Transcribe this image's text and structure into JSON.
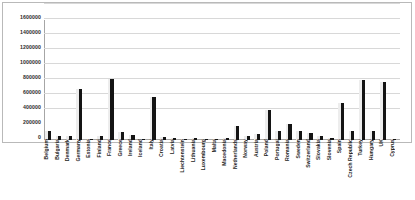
{
  "chart_data": {
    "type": "bar",
    "title": "",
    "xlabel": "",
    "ylabel": "",
    "ylim": [
      0,
      1600000
    ],
    "ytick_step": 200000,
    "grid": true,
    "legend": "none",
    "bar_color": "#141414",
    "gridline_color": "#d8d8d8",
    "axis_color": "#a6a6a6",
    "ytick_labels": [
      "1600000",
      "1400000",
      "1200000",
      "1000000",
      "800000",
      "600000",
      "400000",
      "200000",
      "0"
    ],
    "ytick_values": [
      1600000,
      1400000,
      1200000,
      1000000,
      800000,
      600000,
      400000,
      200000,
      0
    ],
    "categories": [
      "Belgium",
      "Bulgaria",
      "Denmark",
      "Germany",
      "Estonia",
      "Finland",
      "France",
      "Greece",
      "Ireland",
      "Iceland",
      "Italy",
      "Croatia",
      "Latvia",
      "Liechtenstein",
      "Lithuania",
      "Luxembourg",
      "Malta",
      "Macedonia",
      "Netherlands",
      "Norway",
      "Austria",
      "Poland",
      "Portugal",
      "Romania",
      "Sweden",
      "Switzerland",
      "Slovakia",
      "Slovenia",
      "Spain",
      "Czech Republic",
      "Turkey",
      "Hungary",
      "UK",
      "Cyprus"
    ],
    "values": [
      120000,
      58000,
      50000,
      675000,
      15000,
      48000,
      810000,
      110000,
      72000,
      8000,
      575000,
      38000,
      22000,
      5000,
      33000,
      12000,
      8000,
      25000,
      190000,
      48000,
      85000,
      395000,
      120000,
      220000,
      125000,
      95000,
      55000,
      28000,
      490000,
      125000,
      800000,
      120000,
      775000,
      12000
    ]
  }
}
